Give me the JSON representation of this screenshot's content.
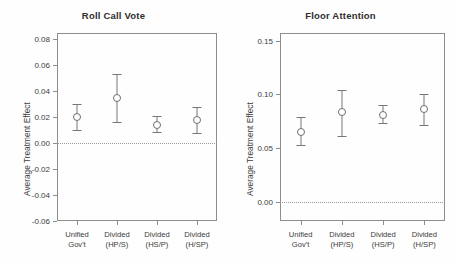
{
  "figure": {
    "background": "#fefefe",
    "marker_color": "#6f6f6f",
    "axis_color": "#8d8d8d",
    "zero_line_color": "#9a9a9a"
  },
  "chart_data": [
    {
      "type": "scatter",
      "panel": "left",
      "title": "Roll Call Vote",
      "xlabel": "",
      "ylabel": "Average Treatment Effect",
      "ylim": [
        -0.06,
        0.085
      ],
      "yticks": [
        0.08,
        0.06,
        0.04,
        0.02,
        0.0,
        -0.02,
        -0.04,
        -0.06
      ],
      "ytick_labels": [
        "0.08",
        "0.06",
        "0.04",
        "0.02",
        "0.00",
        "-0.02",
        "-0.04",
        "-0.06"
      ],
      "grid": false,
      "legend": "none",
      "reference_line": 0.0,
      "categories": [
        "Unified Gov't",
        "Divided (HP/S)",
        "Divided (HS/P)",
        "Divided (H/SP)"
      ],
      "category_lines": [
        [
          "Unified",
          "Gov't"
        ],
        [
          "Divided",
          "(HP/S)"
        ],
        [
          "Divided",
          "(HS/P)"
        ],
        [
          "Divided",
          "(H/SP)"
        ]
      ],
      "values": [
        0.02,
        0.0345,
        0.014,
        0.018
      ],
      "ci_lower": [
        0.01,
        0.016,
        0.009,
        0.008
      ],
      "ci_upper": [
        0.03,
        0.053,
        0.021,
        0.028
      ]
    },
    {
      "type": "scatter",
      "panel": "right",
      "title": "Floor Attention",
      "xlabel": "",
      "ylabel": "Average Treatment Effect",
      "ylim": [
        -0.018,
        0.157
      ],
      "yticks": [
        0.15,
        0.1,
        0.05,
        0.0
      ],
      "ytick_labels": [
        "0.15",
        "0.10",
        "0.05",
        "0.00"
      ],
      "grid": false,
      "legend": "none",
      "reference_line": 0.0,
      "categories": [
        "Unified Gov't",
        "Divided (HP/S)",
        "Divided (HS/P)",
        "Divided (H/SP)"
      ],
      "category_lines": [
        [
          "Unified",
          "Gov't"
        ],
        [
          "Divided",
          "(HP/S)"
        ],
        [
          "Divided",
          "(HS/P)"
        ],
        [
          "Divided",
          "(H/SP)"
        ]
      ],
      "values": [
        0.065,
        0.083,
        0.081,
        0.086
      ],
      "ci_lower": [
        0.053,
        0.061,
        0.073,
        0.071
      ],
      "ci_upper": [
        0.079,
        0.104,
        0.09,
        0.1
      ]
    }
  ]
}
